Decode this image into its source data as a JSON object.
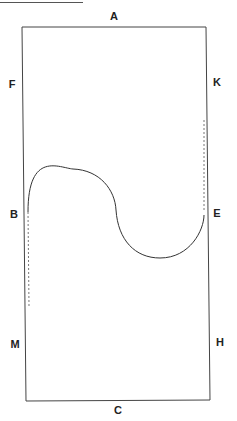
{
  "diagram": {
    "type": "dressage-arena-figure",
    "figure": "serpentine (two half-circles from B to E)",
    "markers": {
      "top": "A",
      "bottom": "C",
      "left_upper": "F",
      "left_middle": "B",
      "left_lower": "M",
      "right_upper": "K",
      "right_middle": "E",
      "right_lower": "H"
    }
  }
}
